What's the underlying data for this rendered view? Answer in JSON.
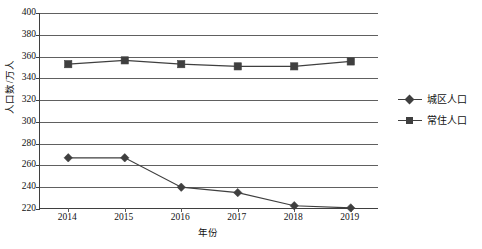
{
  "chart_data": {
    "type": "line",
    "title": "",
    "xlabel": "年份",
    "ylabel": "人口数/万人",
    "categories": [
      "2014",
      "2015",
      "2016",
      "2017",
      "2018",
      "2019"
    ],
    "ylim": [
      220,
      400
    ],
    "ytick_step": 20,
    "yticks": [
      "400",
      "380",
      "360",
      "340",
      "320",
      "300",
      "280",
      "260",
      "240",
      "220"
    ],
    "grid": true,
    "legend_position": "right",
    "series": [
      {
        "name": "城区人口",
        "marker": "diamond",
        "color": "#3f3f3f",
        "values": [
          267,
          267,
          240,
          235,
          223,
          221
        ]
      },
      {
        "name": "常住人口",
        "marker": "square",
        "color": "#3f3f3f",
        "values": [
          353,
          356.5,
          353,
          351,
          351,
          355.5
        ]
      }
    ]
  },
  "legend": {
    "items": [
      {
        "label": "城区人口",
        "marker": "diamond-marker-icon"
      },
      {
        "label": "常住人口",
        "marker": "square-marker-icon"
      }
    ]
  },
  "colors": {
    "series_stroke": "#3f3f3f",
    "gridline": "#606060",
    "axis": "#3f3f3f",
    "text": "#111111",
    "background": "#ffffff"
  }
}
